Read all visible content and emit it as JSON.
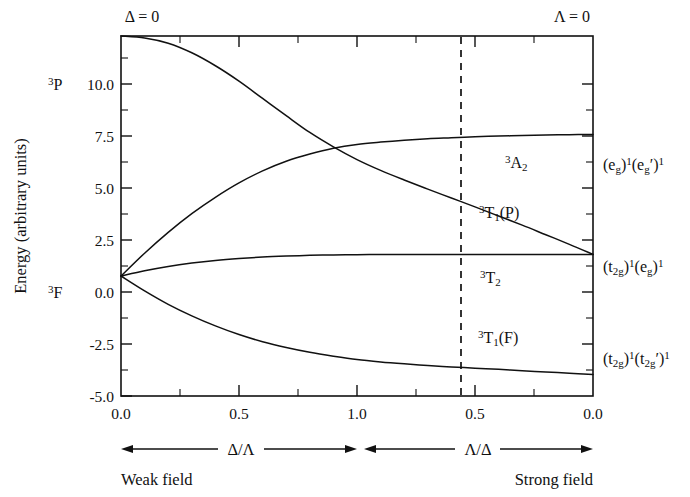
{
  "figure": {
    "top_left_label": "Δ = 0",
    "top_right_label": "Λ = 0",
    "y_axis_title": "Energy (arbitrary units)",
    "weak_field_label": "Weak field",
    "strong_field_label": "Strong field",
    "left_ratio_label": "Δ/Λ",
    "right_ratio_label": "Λ/Δ"
  },
  "free_ion_terms": [
    {
      "name": "term-3P",
      "sup": "3",
      "body": "P",
      "energy": 10.0
    },
    {
      "name": "term-3F",
      "sup": "3",
      "body": "F",
      "energy": 0.0
    }
  ],
  "y_ticks": [
    {
      "value": 10.0,
      "label": "10.0"
    },
    {
      "value": 7.5,
      "label": "7.5"
    },
    {
      "value": 5.0,
      "label": "5.0"
    },
    {
      "value": 2.5,
      "label": "2.5"
    },
    {
      "value": 0.0,
      "label": "0.0"
    },
    {
      "value": -2.5,
      "label": "-2.5"
    },
    {
      "value": -5.0,
      "label": "-5.0"
    }
  ],
  "x_ticks": [
    {
      "pos": 0.0,
      "label": "0.0"
    },
    {
      "pos": 0.25,
      "label": ""
    },
    {
      "pos": 0.5,
      "label": "0.5"
    },
    {
      "pos": 0.75,
      "label": ""
    },
    {
      "pos": 1.0,
      "label": "1.0"
    },
    {
      "pos": 1.25,
      "label": ""
    },
    {
      "pos": 1.5,
      "label": "0.5"
    },
    {
      "pos": 1.75,
      "label": ""
    },
    {
      "pos": 2.0,
      "label": "0.0"
    }
  ],
  "state_labels": [
    {
      "name": "state-label-3A2",
      "sup": "3",
      "body": "A",
      "sub": "2",
      "tail": "",
      "x": 505,
      "y": 168
    },
    {
      "name": "state-label-3T1P",
      "sup": "3",
      "body": "T",
      "sub": "1",
      "tail": "(P)",
      "x": 479,
      "y": 218
    },
    {
      "name": "state-label-3T2",
      "sup": "3",
      "body": "T",
      "sub": "2",
      "tail": "",
      "x": 480,
      "y": 283
    },
    {
      "name": "state-label-3T1F",
      "sup": "3",
      "body": "T",
      "sub": "1",
      "tail": "(F)",
      "x": 478,
      "y": 343
    }
  ],
  "config_labels": [
    {
      "name": "config-label-eg-egprime",
      "text": "(e",
      "sub1": "g",
      "mid": ")",
      "sup1": "1",
      "text2": "(e",
      "sub2": "g",
      "prime": "′",
      "mid2": ")",
      "sup2": "1",
      "x": 603,
      "y": 170
    },
    {
      "name": "config-label-t2g-eg",
      "text": "(t",
      "sub1": "2g",
      "mid": ")",
      "sup1": "1",
      "text2": "(e",
      "sub2": "g",
      "prime": "",
      "mid2": ")",
      "sup2": "1",
      "x": 603,
      "y": 272
    },
    {
      "name": "config-label-t2g-t2gprime",
      "text": "(t",
      "sub1": "2g",
      "mid": ")",
      "sup1": "1",
      "text2": "(t",
      "sub2": "2g",
      "prime": "′",
      "mid2": ")",
      "sup2": "1",
      "x": 603,
      "y": 364
    }
  ],
  "chart_data": {
    "type": "line",
    "title": "",
    "xlabel": "Δ/Λ  |  Λ/Δ",
    "ylabel": "Energy (arbitrary units)",
    "ylim": [
      -5.0,
      10.0
    ],
    "xlim": [
      0.0,
      2.0
    ],
    "grid": false,
    "legend": "none",
    "x_tick_labels": [
      "0.0",
      "0.5",
      "1.0",
      "0.5",
      "0.0"
    ],
    "x_tick_positions": [
      0.0,
      0.5,
      1.0,
      1.5,
      2.0
    ],
    "y_tick_labels": [
      "10.0",
      "7.5",
      "5.0",
      "2.5",
      "0.0",
      "-2.5",
      "-5.0"
    ],
    "annotations": [
      {
        "text": "Δ = 0",
        "at": "top-left-axis"
      },
      {
        "text": "Λ = 0",
        "at": "top-right-axis"
      },
      {
        "text": "dashed vertical divider",
        "x": 1.48
      }
    ],
    "series": [
      {
        "name": "3T1(P) from 3P",
        "points": [
          [
            0.0,
            10.0
          ],
          [
            0.1,
            9.92
          ],
          [
            0.2,
            9.7
          ],
          [
            0.3,
            9.3
          ],
          [
            0.4,
            8.76
          ],
          [
            0.5,
            8.12
          ],
          [
            0.6,
            7.4
          ],
          [
            0.7,
            6.68
          ],
          [
            0.8,
            5.98
          ],
          [
            0.9,
            5.38
          ],
          [
            1.0,
            4.85
          ],
          [
            1.1,
            4.4
          ],
          [
            1.2,
            4.0
          ],
          [
            1.3,
            3.62
          ],
          [
            1.4,
            3.25
          ],
          [
            1.5,
            2.88
          ],
          [
            1.6,
            2.5
          ],
          [
            1.7,
            2.12
          ],
          [
            1.8,
            1.72
          ],
          [
            1.9,
            1.32
          ],
          [
            2.0,
            0.9
          ]
        ]
      },
      {
        "name": "3A2 from 3F",
        "points": [
          [
            0.0,
            0.0
          ],
          [
            0.1,
            0.95
          ],
          [
            0.2,
            1.82
          ],
          [
            0.3,
            2.6
          ],
          [
            0.4,
            3.28
          ],
          [
            0.5,
            3.88
          ],
          [
            0.6,
            4.38
          ],
          [
            0.7,
            4.78
          ],
          [
            0.8,
            5.08
          ],
          [
            0.9,
            5.32
          ],
          [
            1.0,
            5.48
          ],
          [
            1.1,
            5.58
          ],
          [
            1.2,
            5.66
          ],
          [
            1.3,
            5.72
          ],
          [
            1.4,
            5.76
          ],
          [
            1.5,
            5.8
          ],
          [
            1.6,
            5.83
          ],
          [
            1.7,
            5.85
          ],
          [
            1.8,
            5.87
          ],
          [
            1.9,
            5.89
          ],
          [
            2.0,
            5.9
          ]
        ]
      },
      {
        "name": "3T2 from 3F",
        "points": [
          [
            0.0,
            0.0
          ],
          [
            0.1,
            0.22
          ],
          [
            0.2,
            0.4
          ],
          [
            0.3,
            0.54
          ],
          [
            0.4,
            0.65
          ],
          [
            0.5,
            0.73
          ],
          [
            0.6,
            0.79
          ],
          [
            0.7,
            0.83
          ],
          [
            0.8,
            0.86
          ],
          [
            0.9,
            0.88
          ],
          [
            1.0,
            0.89
          ],
          [
            1.1,
            0.9
          ],
          [
            1.2,
            0.9
          ],
          [
            1.3,
            0.9
          ],
          [
            1.4,
            0.9
          ],
          [
            1.5,
            0.9
          ],
          [
            1.6,
            0.9
          ],
          [
            1.7,
            0.9
          ],
          [
            1.8,
            0.9
          ],
          [
            1.9,
            0.9
          ],
          [
            2.0,
            0.9
          ]
        ]
      },
      {
        "name": "3T1(F) from 3F",
        "points": [
          [
            0.0,
            0.0
          ],
          [
            0.1,
            -0.62
          ],
          [
            0.2,
            -1.18
          ],
          [
            0.3,
            -1.66
          ],
          [
            0.4,
            -2.08
          ],
          [
            0.5,
            -2.44
          ],
          [
            0.6,
            -2.74
          ],
          [
            0.7,
            -2.98
          ],
          [
            0.8,
            -3.18
          ],
          [
            0.9,
            -3.34
          ],
          [
            1.0,
            -3.48
          ],
          [
            1.1,
            -3.58
          ],
          [
            1.2,
            -3.66
          ],
          [
            1.3,
            -3.73
          ],
          [
            1.4,
            -3.79
          ],
          [
            1.5,
            -3.84
          ],
          [
            1.6,
            -3.89
          ],
          [
            1.7,
            -3.95
          ],
          [
            1.8,
            -4.0
          ],
          [
            1.9,
            -4.05
          ],
          [
            2.0,
            -4.1
          ]
        ]
      }
    ],
    "crossings": [
      {
        "between": [
          "3T1(P) from 3P",
          "3A2 from 3F"
        ],
        "x": 0.88,
        "y": 5.22
      }
    ]
  }
}
